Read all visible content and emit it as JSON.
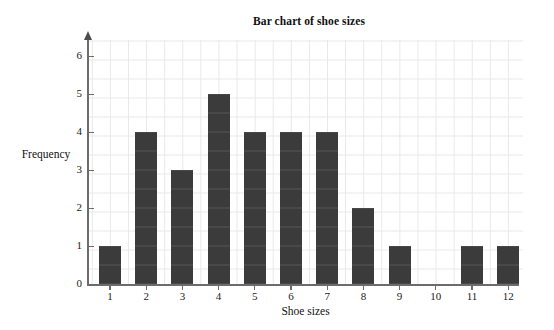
{
  "chart_data": {
    "type": "bar",
    "title": "Bar chart of shoe sizes",
    "xlabel": "Shoe sizes",
    "ylabel": "Frequency",
    "categories": [
      "1",
      "2",
      "3",
      "4",
      "5",
      "6",
      "7",
      "8",
      "9",
      "10",
      "11",
      "12"
    ],
    "values": [
      1,
      4,
      3,
      5,
      4,
      4,
      4,
      2,
      1,
      0,
      1,
      1
    ],
    "xlim": [
      0.4,
      12.6
    ],
    "ylim": [
      0,
      6.3
    ],
    "ytick_labels": [
      "0",
      "1",
      "2",
      "3",
      "4",
      "5",
      "6"
    ],
    "ytick_values": [
      0,
      1,
      2,
      3,
      4,
      5,
      6
    ],
    "xtick_labels": [
      "1",
      "2",
      "3",
      "4",
      "5",
      "6",
      "7",
      "8",
      "9",
      "10",
      "11",
      "12"
    ],
    "grid": true,
    "grid_minor": true,
    "legend": null,
    "bar_color": "#3b3b3b",
    "grid_color": "#e8e8e8",
    "axis_color": "#6c6c6c",
    "background": "#ffffff"
  }
}
